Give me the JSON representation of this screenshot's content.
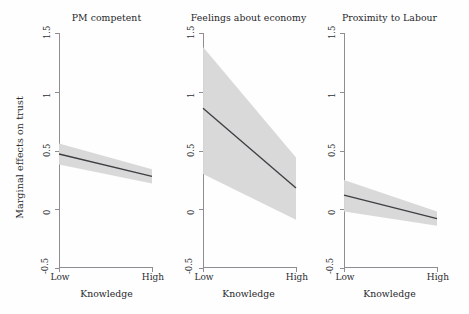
{
  "chart_data": {
    "type": "line",
    "title": "",
    "subtitle": "",
    "ylabel": "Marginal effects on trust",
    "xlabel": "Knowledge",
    "ylim": [
      -0.5,
      1.5
    ],
    "yticks": [
      1.5,
      1,
      0.5,
      0,
      -0.5
    ],
    "ytick_labels": [
      "1.5",
      "1",
      "0.5",
      "0",
      "-0.5"
    ],
    "xlim": [
      0,
      1
    ],
    "xticks": [
      0,
      1
    ],
    "xtick_labels": [
      "Low",
      "High"
    ],
    "grid": false,
    "legend": "none",
    "band_color": "#d8d8d8",
    "line_color": "#3e3e44",
    "band_description": "95% confidence interval shaded gray",
    "panels": [
      {
        "title": "PM competent",
        "x": [
          0,
          1
        ],
        "fit": [
          0.47,
          0.28
        ],
        "ci_upper": [
          0.56,
          0.34
        ],
        "ci_lower": [
          0.38,
          0.22
        ],
        "xlabel": "Knowledge",
        "xtick_labels": [
          "Low",
          "High"
        ]
      },
      {
        "title": "Feelings about economy",
        "x": [
          0,
          1
        ],
        "fit": [
          0.86,
          0.18
        ],
        "ci_upper": [
          1.38,
          0.44
        ],
        "ci_lower": [
          0.3,
          -0.09
        ],
        "xlabel": "Knowledge",
        "xtick_labels": [
          "Low",
          "High"
        ]
      },
      {
        "title": "Proximity to Labour",
        "x": [
          0,
          1
        ],
        "fit": [
          0.12,
          -0.08
        ],
        "ci_upper": [
          0.25,
          -0.02
        ],
        "ci_lower": [
          -0.02,
          -0.14
        ],
        "xlabel": "Knowledge",
        "xtick_labels": [
          "Low",
          "High"
        ]
      }
    ]
  }
}
